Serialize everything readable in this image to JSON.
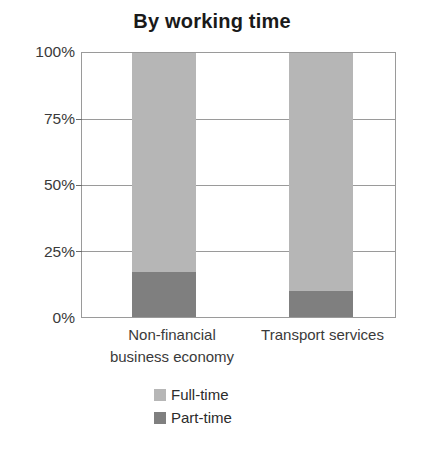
{
  "chart_data": {
    "type": "bar",
    "subtype": "stacked-percent-column",
    "title": "By working time",
    "xlabel": "",
    "ylabel": "",
    "ylim": [
      0,
      100
    ],
    "yticks": [
      0,
      25,
      50,
      75,
      100
    ],
    "ytick_labels": [
      "0%",
      "25%",
      "50%",
      "75%",
      "100%"
    ],
    "categories": [
      "Non-financial business economy",
      "Transport services"
    ],
    "category_label_lines": [
      [
        "Non-financial",
        "business economy"
      ],
      [
        "Transport services"
      ]
    ],
    "series": [
      {
        "name": "Full-time",
        "values": [
          83,
          90
        ],
        "color": "#b6b6b6"
      },
      {
        "name": "Part-time",
        "values": [
          17,
          10
        ],
        "color": "#7f7f7f"
      }
    ],
    "stack_order_bottom_to_top": [
      "Part-time",
      "Full-time"
    ],
    "grid": true,
    "legend_position": "bottom"
  },
  "axis": {
    "ticks": [
      {
        "label": "100%",
        "value": 100
      },
      {
        "label": "75%",
        "value": 75
      },
      {
        "label": "50%",
        "value": 50
      },
      {
        "label": "25%",
        "value": 25
      },
      {
        "label": "0%",
        "value": 0
      }
    ]
  },
  "legend": {
    "items": [
      {
        "label": "Full-time",
        "color": "#b6b6b6"
      },
      {
        "label": "Part-time",
        "color": "#7f7f7f"
      }
    ]
  }
}
